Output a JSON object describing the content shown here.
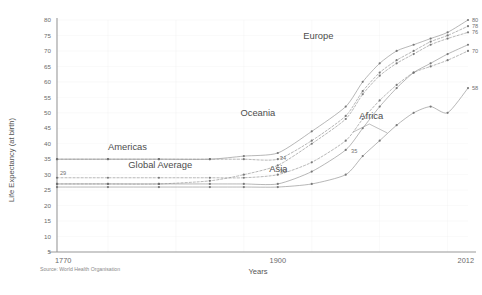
{
  "chart_data": {
    "type": "line",
    "title": "",
    "xlabel": "Years",
    "ylabel": "Life Expectancy (at birth)",
    "xlim": [
      1770,
      2012
    ],
    "ylim": [
      0,
      80
    ],
    "grid": true,
    "legend_position": "inline-annotations",
    "xticks": [
      "1770",
      "1900",
      "2012"
    ],
    "xtick_values": [
      1770,
      1900,
      2012
    ],
    "yticks": [
      "5",
      "10",
      "15",
      "20",
      "25",
      "30",
      "35",
      "40",
      "45",
      "50",
      "55",
      "60",
      "65",
      "70",
      "75",
      "80"
    ],
    "ytick_values": [
      5,
      10,
      15,
      20,
      25,
      30,
      35,
      40,
      45,
      50,
      55,
      60,
      65,
      70,
      75,
      80
    ],
    "source": "Source: World Health Organisation",
    "series": [
      {
        "name": "Europe",
        "label_x": 1915,
        "label_y": 74,
        "end_label": "80",
        "x": [
          1770,
          1800,
          1830,
          1860,
          1880,
          1900,
          1920,
          1940,
          1950,
          1960,
          1970,
          1980,
          1990,
          2000,
          2012
        ],
        "y": [
          35,
          35,
          35,
          35,
          36,
          37,
          44,
          52,
          60,
          66,
          70,
          72,
          74,
          76,
          80
        ]
      },
      {
        "name": "Americas",
        "label_x": 1800,
        "label_y": 38,
        "end_label": "78",
        "x": [
          1770,
          1800,
          1830,
          1860,
          1880,
          1900,
          1920,
          1940,
          1950,
          1960,
          1970,
          1980,
          1990,
          2000,
          2012
        ],
        "y": [
          35,
          35,
          35,
          35,
          35,
          35,
          41,
          49,
          57,
          63,
          67,
          70,
          73,
          75,
          78
        ]
      },
      {
        "name": "Oceania",
        "label_x": 1878,
        "label_y": 49,
        "end_label": "76",
        "x": [
          1770,
          1800,
          1830,
          1860,
          1880,
          1900,
          1920,
          1940,
          1950,
          1960,
          1970,
          1980,
          1990,
          2000,
          2012
        ],
        "y": [
          27,
          27,
          27,
          28,
          30,
          33,
          40,
          48,
          56,
          62,
          66,
          69,
          72,
          74,
          76
        ]
      },
      {
        "name": "Global Average",
        "label_x": 1812,
        "label_y": 32,
        "end_label": "70",
        "mid_label": "30",
        "mid_label_value": 30,
        "start_label": "29",
        "x": [
          1770,
          1800,
          1830,
          1860,
          1880,
          1900,
          1920,
          1940,
          1950,
          1960,
          1970,
          1980,
          1990,
          2000,
          2012
        ],
        "y": [
          29,
          29,
          29,
          29,
          29,
          30,
          34,
          41,
          48,
          54,
          59,
          63,
          65,
          67,
          70
        ]
      },
      {
        "name": "Asia",
        "label_x": 1895,
        "label_y": 31,
        "mid_label": "34",
        "mid_label_value": 34,
        "x": [
          1770,
          1800,
          1830,
          1860,
          1880,
          1900,
          1920,
          1940,
          1950,
          1960,
          1970,
          1980,
          1990,
          2000,
          2012
        ],
        "y": [
          27,
          27,
          27,
          27,
          27,
          27,
          31,
          38,
          45,
          52,
          58,
          63,
          66,
          69,
          72
        ]
      },
      {
        "name": "Africa",
        "label_x": 1948,
        "label_y": 48,
        "end_label": "58",
        "x": [
          1770,
          1800,
          1830,
          1860,
          1880,
          1900,
          1920,
          1940,
          1950,
          1960,
          1970,
          1980,
          1990,
          2000,
          2012
        ],
        "y": [
          26,
          26,
          26,
          26,
          26,
          26,
          27,
          30,
          36,
          41,
          46,
          50,
          52,
          50,
          58
        ]
      }
    ],
    "annotations": [
      {
        "text": "35",
        "x": 1945,
        "y": 37
      }
    ]
  },
  "colors": {
    "line": "#8e8e8e",
    "axis": "#9a9a9a",
    "grid": "#ececec",
    "text": "#5a5a5a"
  }
}
